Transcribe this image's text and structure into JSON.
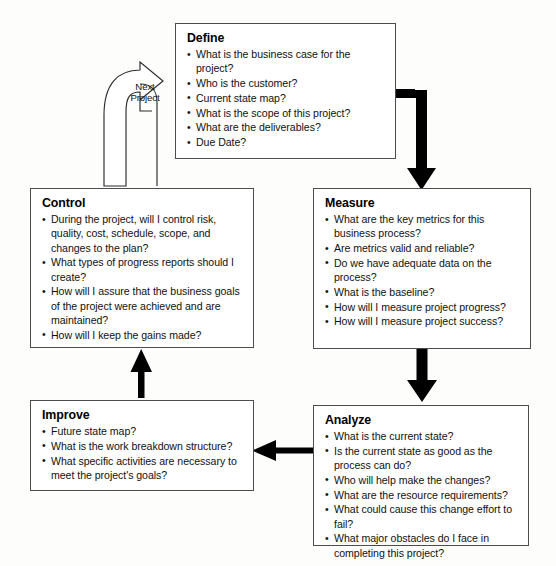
{
  "diagram": {
    "colors": {
      "box_border": "#4d4d4d",
      "arrow_fill": "#000000",
      "background": "#fdfdfc",
      "text": "#111111"
    },
    "loop_label": {
      "line1": "Next",
      "line2": "Project"
    },
    "phases": [
      {
        "id": "define",
        "title": "Define",
        "bullets": [
          "What is the business case for the project?",
          "Who is the customer?",
          "Current state map?",
          "What is the scope of this project?",
          "What are the deliverables?",
          "Due Date?"
        ]
      },
      {
        "id": "measure",
        "title": "Measure",
        "bullets": [
          "What are the key metrics for this business process?",
          "Are metrics valid and reliable?",
          "Do we have adequate data on the process?",
          "What is the baseline?",
          "How will I measure project progress?",
          "How will I measure project success?"
        ]
      },
      {
        "id": "analyze",
        "title": "Analyze",
        "bullets": [
          "What is the current state?",
          "Is the current state as good as the process can do?",
          "Who will help make the changes?",
          "What are the resource requirements?",
          "What could cause this change effort to fail?",
          "What major obstacles do I face in completing this project?"
        ]
      },
      {
        "id": "improve",
        "title": "Improve",
        "bullets": [
          "Future state map?",
          "What is the work breakdown structure?",
          "What specific activities are necessary to meet the project's goals?"
        ]
      },
      {
        "id": "control",
        "title": "Control",
        "bullets": [
          "During the project, will I control risk, quality, cost, schedule, scope, and changes to the plan?",
          "What types of progress reports should I create?",
          "How will I assure that the business goals of the project were achieved and are maintained?",
          "How will I keep the gains made?"
        ]
      }
    ],
    "connectors": [
      {
        "id": "define-to-measure",
        "from": "Define",
        "to": "Measure",
        "style": "elbow-right-down"
      },
      {
        "id": "measure-to-analyze",
        "from": "Measure",
        "to": "Analyze",
        "style": "down"
      },
      {
        "id": "analyze-to-improve",
        "from": "Analyze",
        "to": "Improve",
        "style": "left"
      },
      {
        "id": "improve-to-control",
        "from": "Improve",
        "to": "Control",
        "style": "up"
      },
      {
        "id": "control-to-define",
        "from": "Control",
        "to": "Define",
        "style": "curved-outline-loop"
      }
    ]
  }
}
